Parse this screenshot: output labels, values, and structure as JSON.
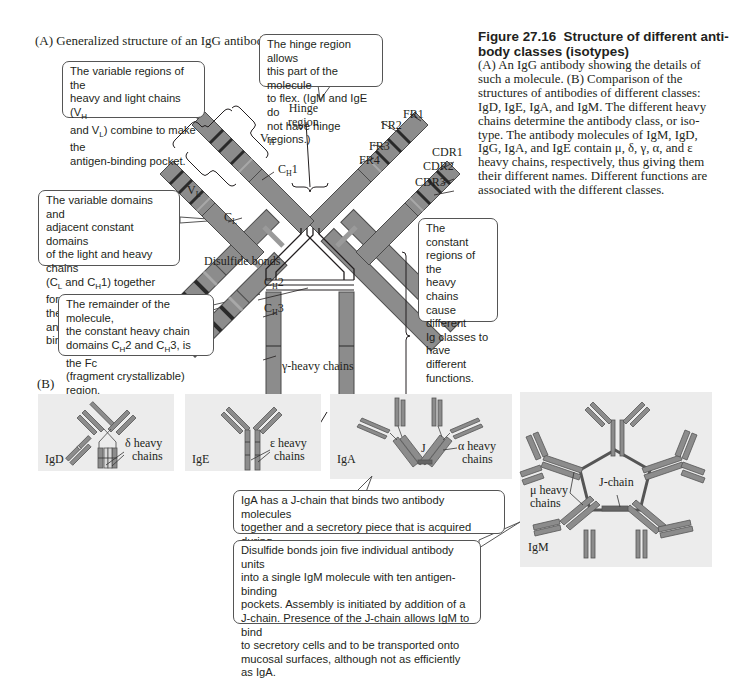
{
  "panel_a": {
    "label": "(A) Generalized structure of an IgG antibody",
    "callouts": {
      "variable": [
        "The variable regions of the",
        "heavy and light chains (V",
        "H",
        " ",
        "and V",
        "L",
        ") combine to make the",
        "antigen-binding pocket."
      ],
      "hinge": [
        "The hinge region allows",
        "this part of the molecule",
        "to flex. (IgM and IgE do",
        "not have hinge regions.)"
      ],
      "fab": [
        "The variable domains and",
        "adjacent constant domains",
        "of the light and heavy chains",
        "(C",
        "L",
        " and C",
        "H",
        "1) together form",
        "the Fab (fragment antigen-",
        "binding) region."
      ],
      "fc": [
        "The remainder of the molecule,",
        "the constant heavy chain",
        "domains C",
        "H",
        "2 and C",
        "H",
        "3, is the Fc",
        "(fragment crystallizable) region."
      ],
      "constant": [
        "The constant",
        "regions of the",
        "heavy chains",
        "cause different",
        "Ig classes to",
        "have different",
        "functions."
      ]
    },
    "labels": {
      "hinge_region_1": "Hinge",
      "hinge_region_2": "region",
      "vh": "V",
      "vh_sub": "H",
      "vl": "V",
      "vl_sub": "L",
      "ch1": "C",
      "ch1_sub": "H",
      "ch1_num": "1",
      "cl": "C",
      "cl_sub": "L",
      "disulfide": "Disulfide bonds",
      "ch2": "C",
      "ch2_sub": "H",
      "ch2_num": "2",
      "ch3": "C",
      "ch3_sub": "H",
      "ch3_num": "3",
      "fr1": "FR1",
      "fr2": "FR2",
      "fr3": "FR3",
      "fr4": "FR4",
      "cdr1": "CDR1",
      "cdr2": "CDR2",
      "cdr3": "CDR3",
      "gamma_chains": "γ-heavy chains"
    }
  },
  "caption": {
    "figure_number": "Figure 27.16",
    "title": "Structure of different anti-body classes (isotypes)",
    "title_line1": "Structure of different anti-",
    "title_line2": "body classes (isotypes)",
    "body": "(A) An IgG antibody showing the details of such a molecule. (B) Comparison of the structures of antibodies of different classes: IgD, IgE, IgA, and IgM. The different heavy chains determine the antibody class, or isotype. The antibody molecules of IgM, IgD, IgG, IgA, and IgE contain μ, δ, γ, α, and ε heavy chains, respectively, thus giving them their different names. Different functions are associated with the different classes.",
    "body_lines": [
      "(A) An IgG antibody showing the details of",
      "such a molecule. (B) Comparison of the",
      "structures of antibodies of different classes:",
      "IgD, IgE, IgA, and IgM. The different heavy",
      "chains determine the antibody class, or iso-",
      "type. The antibody molecules of IgM, IgD,",
      "IgG, IgA, and IgE contain μ, δ, γ, α, and ε",
      "heavy chains, respectively, thus giving them",
      "their different names. Different functions are",
      "associated with the different classes."
    ]
  },
  "panel_b": {
    "label": "(B)",
    "igd": {
      "name": "IgD",
      "chain_label_1": "δ heavy",
      "chain_label_2": "chains"
    },
    "ige": {
      "name": "IgE",
      "chain_label_1": "ε heavy",
      "chain_label_2": "chains"
    },
    "iga": {
      "name": "IgA",
      "j_label": "J",
      "chain_label_1": "α heavy",
      "chain_label_2": "chains"
    },
    "igm": {
      "name": "IgM",
      "j_label": "J-chain",
      "chain_label_1": "μ heavy",
      "chain_label_2": "chains"
    },
    "callouts": {
      "iga": [
        "IgA has a J-chain that binds two antibody molecules",
        "together and a secretory piece that is acquired during",
        "secretion of IgA onto the surface of mucous membranes."
      ],
      "igm": [
        "Disulfide bonds join five individual antibody units",
        "into a single IgM molecule with ten antigen-binding",
        "pockets. Assembly is initiated by addition of a",
        "J-chain. Presence of the J-chain allows IgM to bind",
        "to secretory cells and to be transported onto",
        "mucosal surfaces, although not as efficiently as IgA."
      ]
    }
  },
  "colors": {
    "domain_fill": "#8c8c8c",
    "domain_stroke": "#4a4a4a",
    "band_dark": "#2a2a2a",
    "tile_bg": "#ececec",
    "line": "#231f20"
  }
}
